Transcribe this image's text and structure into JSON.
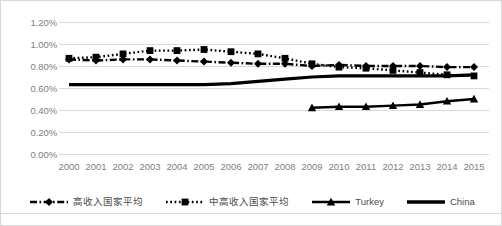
{
  "chart_data": {
    "type": "line",
    "title": "",
    "xlabel": "",
    "ylabel": "",
    "ylim": [
      0.0,
      1.2
    ],
    "yticks": [
      "0.00%",
      "0.20%",
      "0.40%",
      "0.60%",
      "0.80%",
      "1.00%",
      "1.20%"
    ],
    "ytick_values": [
      0.0,
      0.2,
      0.4,
      0.6,
      0.8,
      1.0,
      1.2
    ],
    "grid": true,
    "legend_position": "bottom",
    "categories": [
      "2000",
      "2001",
      "2002",
      "2003",
      "2004",
      "2005",
      "2006",
      "2007",
      "2008",
      "2009",
      "2010",
      "2011",
      "2012",
      "2013",
      "2014",
      "2015"
    ],
    "series": [
      {
        "name": "高收入国家平均",
        "style": "dash-dot",
        "marker": "diamond",
        "color": "#000000",
        "values": [
          0.86,
          0.85,
          0.86,
          0.86,
          0.85,
          0.84,
          0.83,
          0.82,
          0.82,
          0.8,
          0.81,
          0.8,
          0.8,
          0.8,
          0.79,
          0.79
        ]
      },
      {
        "name": "中高收入国家平均",
        "style": "dotted",
        "marker": "square",
        "color": "#000000",
        "values": [
          0.87,
          0.88,
          0.91,
          0.94,
          0.94,
          0.95,
          0.93,
          0.91,
          0.87,
          0.82,
          0.79,
          0.78,
          0.76,
          0.74,
          0.72,
          0.71
        ]
      },
      {
        "name": "Turkey",
        "style": "solid",
        "marker": "triangle",
        "color": "#000000",
        "values": [
          null,
          null,
          null,
          null,
          null,
          null,
          null,
          null,
          null,
          0.42,
          0.43,
          0.43,
          0.44,
          0.45,
          0.48,
          0.5
        ]
      },
      {
        "name": "China",
        "style": "solid",
        "marker": "none",
        "color": "#000000",
        "values": [
          0.63,
          0.63,
          0.63,
          0.63,
          0.63,
          0.63,
          0.64,
          0.66,
          0.68,
          0.7,
          0.71,
          0.71,
          0.71,
          0.71,
          0.71,
          0.72
        ]
      }
    ]
  },
  "legend": {
    "items": [
      {
        "label": "高收入国家平均",
        "swatch": "dash-dot-diamond-swatch"
      },
      {
        "label": "中高收入国家平均",
        "swatch": "dotted-square-swatch"
      },
      {
        "label": "Turkey",
        "swatch": "solid-triangle-swatch"
      },
      {
        "label": "China",
        "swatch": "solid-line-swatch"
      }
    ]
  }
}
